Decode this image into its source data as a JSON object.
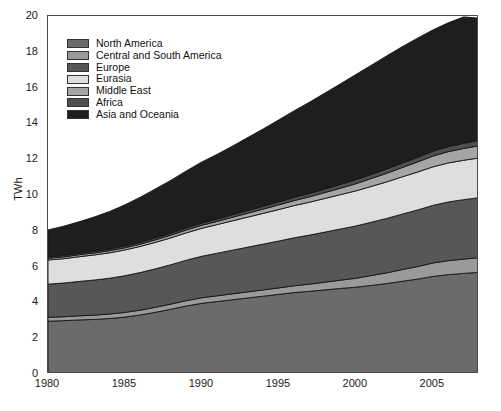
{
  "chart_data": {
    "type": "area",
    "stacked": true,
    "title": "",
    "xlabel": "",
    "ylabel": "TWh",
    "xlim": [
      1980,
      2008
    ],
    "ylim": [
      0,
      20
    ],
    "ytick_step": 2,
    "xtick_step": 5,
    "grid": false,
    "legend_position": "top-left",
    "x": [
      1980,
      1981,
      1982,
      1983,
      1984,
      1985,
      1986,
      1987,
      1988,
      1989,
      1990,
      1991,
      1992,
      1993,
      1994,
      1995,
      1996,
      1997,
      1998,
      1999,
      2000,
      2001,
      2002,
      2003,
      2004,
      2005,
      2006,
      2007,
      2008
    ],
    "y_ticks": [
      0,
      2,
      4,
      6,
      8,
      10,
      12,
      14,
      16,
      18,
      20
    ],
    "x_ticks": [
      1980,
      1985,
      1990,
      1995,
      2000,
      2005
    ],
    "series": [
      {
        "name": "North America",
        "color": "#6b6b6b",
        "values": [
          2.95,
          2.98,
          3.02,
          3.05,
          3.1,
          3.18,
          3.3,
          3.45,
          3.62,
          3.8,
          3.95,
          4.05,
          4.15,
          4.25,
          4.35,
          4.45,
          4.55,
          4.62,
          4.7,
          4.78,
          4.85,
          4.95,
          5.05,
          5.18,
          5.3,
          5.45,
          5.55,
          5.62,
          5.68
        ]
      },
      {
        "name": "Central and South America",
        "color": "#9a9a9a",
        "values": [
          0.22,
          0.22,
          0.23,
          0.24,
          0.25,
          0.26,
          0.27,
          0.28,
          0.29,
          0.3,
          0.31,
          0.32,
          0.33,
          0.34,
          0.35,
          0.36,
          0.38,
          0.4,
          0.43,
          0.46,
          0.5,
          0.55,
          0.6,
          0.65,
          0.7,
          0.75,
          0.78,
          0.8,
          0.82
        ]
      },
      {
        "name": "Europe",
        "color": "#575757",
        "values": [
          1.85,
          1.88,
          1.92,
          1.96,
          2.0,
          2.05,
          2.1,
          2.15,
          2.2,
          2.26,
          2.32,
          2.38,
          2.44,
          2.5,
          2.56,
          2.62,
          2.68,
          2.74,
          2.8,
          2.86,
          2.92,
          2.98,
          3.04,
          3.1,
          3.16,
          3.22,
          3.28,
          3.32,
          3.35
        ]
      },
      {
        "name": "Eurasia",
        "color": "#dedede",
        "values": [
          1.35,
          1.36,
          1.38,
          1.4,
          1.42,
          1.44,
          1.46,
          1.48,
          1.5,
          1.53,
          1.56,
          1.6,
          1.64,
          1.68,
          1.72,
          1.76,
          1.8,
          1.84,
          1.88,
          1.92,
          1.96,
          2.0,
          2.04,
          2.08,
          2.12,
          2.15,
          2.18,
          2.2,
          2.22
        ]
      },
      {
        "name": "Middle East",
        "color": "#a5a5a5",
        "values": [
          0.1,
          0.1,
          0.11,
          0.11,
          0.12,
          0.12,
          0.13,
          0.14,
          0.15,
          0.16,
          0.17,
          0.18,
          0.2,
          0.22,
          0.24,
          0.26,
          0.28,
          0.3,
          0.33,
          0.36,
          0.4,
          0.44,
          0.48,
          0.52,
          0.56,
          0.6,
          0.63,
          0.66,
          0.68
        ]
      },
      {
        "name": "Africa",
        "color": "#4f4f4f",
        "values": [
          0.08,
          0.08,
          0.08,
          0.09,
          0.09,
          0.1,
          0.1,
          0.11,
          0.11,
          0.12,
          0.12,
          0.13,
          0.14,
          0.15,
          0.16,
          0.17,
          0.18,
          0.19,
          0.2,
          0.21,
          0.22,
          0.23,
          0.24,
          0.25,
          0.26,
          0.27,
          0.28,
          0.29,
          0.3
        ]
      },
      {
        "name": "Asia and Oceania",
        "color": "#1e1e1e",
        "values": [
          1.5,
          1.63,
          1.76,
          1.92,
          2.1,
          2.3,
          2.52,
          2.74,
          2.96,
          3.18,
          3.42,
          3.62,
          3.84,
          4.08,
          4.32,
          4.58,
          4.84,
          5.1,
          5.36,
          5.62,
          5.88,
          6.1,
          6.32,
          6.5,
          6.66,
          6.78,
          6.92,
          7.06,
          6.83
        ]
      }
    ],
    "totals": [
      8.05,
      8.25,
      8.5,
      8.77,
      9.08,
      9.45,
      9.88,
      10.35,
      10.83,
      11.35,
      11.85,
      12.28,
      12.74,
      13.22,
      13.7,
      14.2,
      14.71,
      15.19,
      15.7,
      16.21,
      16.73,
      17.25,
      17.77,
      18.28,
      18.76,
      19.22,
      19.62,
      19.95,
      19.88
    ],
    "units": "TWh"
  },
  "axes": {
    "ylabel": "TWh",
    "y_tick_labels": [
      "0",
      "2",
      "4",
      "6",
      "8",
      "10",
      "12",
      "14",
      "16",
      "18",
      "20"
    ],
    "x_tick_labels": [
      "1980",
      "1985",
      "1990",
      "1995",
      "2000",
      "2005"
    ]
  },
  "legend": {
    "items": [
      {
        "label": "North America",
        "color": "#6b6b6b"
      },
      {
        "label": "Central and South America",
        "color": "#9a9a9a"
      },
      {
        "label": "Europe",
        "color": "#575757"
      },
      {
        "label": "Eurasia",
        "color": "#dedede"
      },
      {
        "label": "Middle East",
        "color": "#a5a5a5"
      },
      {
        "label": "Africa",
        "color": "#4f4f4f"
      },
      {
        "label": "Asia and Oceania",
        "color": "#1e1e1e"
      }
    ]
  }
}
